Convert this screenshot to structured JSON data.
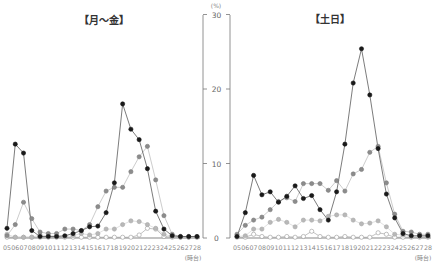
{
  "chart_data": [
    {
      "type": "line",
      "title": "【月～金】",
      "xlabel": "(時台)",
      "ylabel": "(%)",
      "ylim": [
        0,
        30
      ],
      "yticks": [
        0,
        10,
        20,
        30
      ],
      "grid": false,
      "categories": [
        "05",
        "06",
        "07",
        "08",
        "09",
        "10",
        "11",
        "12",
        "13",
        "14",
        "15",
        "16",
        "17",
        "18",
        "19",
        "20",
        "21",
        "22",
        "23",
        "24",
        "25",
        "26",
        "27",
        "28"
      ],
      "series": [
        {
          "name": "series-black",
          "color": "#1a1a1a",
          "line": true,
          "values": [
            1.3,
            12.6,
            11.4,
            1.0,
            0.2,
            0.2,
            0.2,
            0.3,
            0.6,
            1.0,
            1.5,
            1.6,
            3.4,
            7.4,
            18.0,
            14.6,
            13.2,
            9.3,
            3.6,
            1.2,
            0.3,
            0.2,
            0.2,
            0.2
          ]
        },
        {
          "name": "series-dark-gray",
          "color": "#8c8c8c",
          "line": true,
          "values": [
            0.3,
            1.8,
            4.8,
            2.6,
            0.8,
            0.6,
            0.6,
            1.2,
            1.2,
            1.0,
            1.8,
            4.2,
            6.3,
            6.8,
            6.8,
            8.9,
            10.9,
            12.3,
            7.8,
            3.0,
            0.5,
            0.2,
            0.2,
            0.2
          ]
        },
        {
          "name": "series-light-gray",
          "color": "#b8b8b8",
          "line": true,
          "values": [
            0.5,
            0.1,
            0.1,
            0.1,
            0.4,
            0.3,
            0.3,
            0.2,
            0.3,
            0.6,
            0.4,
            0.6,
            1.2,
            1.2,
            1.8,
            2.3,
            2.2,
            1.8,
            1.3,
            0.5,
            0.2,
            0.1,
            0.1,
            0.1
          ]
        },
        {
          "name": "series-white",
          "color": "#ffffff",
          "line": true,
          "values": [
            0.1,
            0.1,
            0.1,
            0.1,
            0.1,
            0.1,
            0.1,
            0.1,
            0.1,
            0.1,
            0.1,
            0.1,
            0.1,
            0.1,
            0.1,
            0.1,
            0.4,
            1.3,
            1.2,
            0.2,
            0.1,
            0.1,
            0.1,
            0.1
          ]
        }
      ]
    },
    {
      "type": "line",
      "title": "【土日】",
      "xlabel": "(時台)",
      "ylabel": "(%)",
      "ylim": [
        0,
        30
      ],
      "yticks": [
        0,
        10,
        20,
        30
      ],
      "grid": false,
      "categories": [
        "05",
        "06",
        "07",
        "08",
        "09",
        "10",
        "11",
        "12",
        "13",
        "14",
        "15",
        "16",
        "17",
        "18",
        "19",
        "20",
        "21",
        "22",
        "23",
        "24",
        "25",
        "26",
        "27",
        "28"
      ],
      "series": [
        {
          "name": "series-black",
          "color": "#1a1a1a",
          "line": true,
          "values": [
            0.2,
            3.4,
            8.4,
            5.8,
            6.2,
            4.8,
            5.6,
            7.0,
            5.3,
            5.7,
            3.8,
            2.4,
            6.2,
            12.6,
            20.8,
            25.4,
            19.2,
            12.0,
            5.9,
            2.7,
            0.6,
            0.3,
            0.3,
            0.3
          ]
        },
        {
          "name": "series-dark-gray",
          "color": "#8c8c8c",
          "line": true,
          "values": [
            0.5,
            1.7,
            2.4,
            2.8,
            3.8,
            4.9,
            5.4,
            4.9,
            7.3,
            7.3,
            7.3,
            6.4,
            7.7,
            6.3,
            8.6,
            9.2,
            11.5,
            12.3,
            7.4,
            3.2,
            0.9,
            0.8,
            0.5,
            0.5
          ]
        },
        {
          "name": "series-light-gray",
          "color": "#b8b8b8",
          "line": true,
          "values": [
            0.2,
            0.3,
            1.2,
            1.2,
            2.1,
            2.5,
            2.1,
            1.5,
            2.4,
            2.4,
            2.3,
            2.9,
            3.1,
            3.1,
            2.4,
            1.9,
            2.0,
            2.3,
            1.5,
            0.5,
            0.4,
            0.2,
            0.2,
            0.2
          ]
        },
        {
          "name": "series-white",
          "color": "#ffffff",
          "line": true,
          "values": [
            0.1,
            0.1,
            0.5,
            0.2,
            0.1,
            0.1,
            0.2,
            0.1,
            0.2,
            0.9,
            0.2,
            0.1,
            0.1,
            0.2,
            0.1,
            0.1,
            0.1,
            0.7,
            0.5,
            0.1,
            0.1,
            0.1,
            0.1,
            0.1
          ]
        }
      ]
    }
  ],
  "left": {
    "title": "【月～金】",
    "x_unit": "(時台)"
  },
  "right": {
    "title": "【土日】",
    "x_unit": "(時台)"
  },
  "axis": {
    "unit": "(%)",
    "ticks": [
      "0",
      "10",
      "20",
      "30"
    ]
  }
}
